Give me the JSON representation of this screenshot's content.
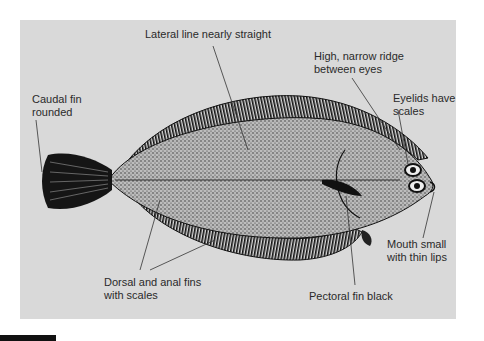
{
  "diagram": {
    "background_color": "#d9d9d9",
    "labels": {
      "lateral_line": "Lateral line nearly straight",
      "caudal_line1": "Caudal fin",
      "caudal_line2": "rounded",
      "ridge_line1": "High, narrow ridge",
      "ridge_line2": "between eyes",
      "eyelids_line1": "Eyelids have",
      "eyelids_line2": "scales",
      "fins_line1": "Dorsal and anal fins",
      "fins_line2": "with scales",
      "mouth_line1": "Mouth small",
      "mouth_line2": "with thin lips",
      "pectoral": "Pectoral fin black"
    }
  }
}
